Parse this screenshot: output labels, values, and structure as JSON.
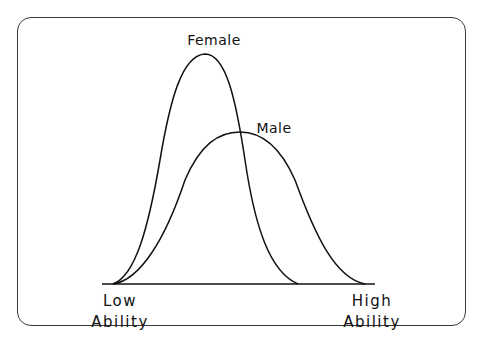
{
  "diagram": {
    "title": "",
    "curves": [
      {
        "name": "Female",
        "label": "Female",
        "peak": "tall, narrow",
        "peak_position": "left of center"
      },
      {
        "name": "Male",
        "label": "Male",
        "peak": "lower, wider",
        "peak_position": "center"
      }
    ],
    "axis": {
      "low_label_line1": "Low",
      "low_label_line2": "Ability",
      "high_label_line1": "High",
      "high_label_line2": "Ability"
    },
    "colors": {
      "stroke": "#111111",
      "frame": "#3a3a3a",
      "background": "#ffffff"
    }
  }
}
